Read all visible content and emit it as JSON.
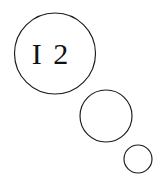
{
  "figure": {
    "background_color": "#ffffff",
    "stroke_color": "#1a1a1a",
    "text_color": "#111111",
    "width": 160,
    "height": 185,
    "circles": [
      {
        "name": "large-circle",
        "label": "I 2",
        "cx": 55,
        "cy": 53.5,
        "r": 40.5,
        "label_x": 51,
        "label_y": 64
      },
      {
        "name": "medium-circle",
        "label": "",
        "cx": 106,
        "cy": 116,
        "r": 26,
        "label_x": 106,
        "label_y": 116
      },
      {
        "name": "small-circle",
        "label": "",
        "cx": 138,
        "cy": 159,
        "r": 14,
        "label_x": 138,
        "label_y": 159
      }
    ]
  }
}
